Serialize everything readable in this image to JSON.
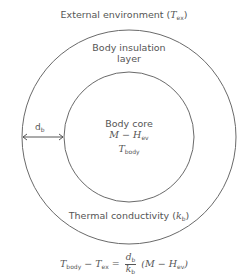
{
  "diagram": {
    "external_label": "External environment",
    "external_symbol": "T",
    "external_symbol_sub": "ex",
    "insulation_label_line1": "Body insulation",
    "insulation_label_line2": "layer",
    "core_label": "Body core",
    "core_heat_expr": "M − H",
    "core_heat_sub": "ev",
    "core_temp_symbol": "T",
    "core_temp_sub": "body",
    "thickness_label": "d",
    "thickness_sub": "b",
    "conductivity_label": "Thermal conductivity",
    "conductivity_symbol": "k",
    "conductivity_sub": "b",
    "equation": {
      "lhs_t1": "T",
      "lhs_t1_sub": "body",
      "minus": " − ",
      "lhs_t2": "T",
      "lhs_t2_sub": "ex",
      "equals": " = ",
      "frac_num": "d",
      "frac_num_sub": "b",
      "frac_den": "k",
      "frac_den_sub": "b",
      "rhs": "(M − H",
      "rhs_sub": "ev",
      "rhs_close": ")"
    },
    "colors": {
      "stroke": "#6a6a6a",
      "text": "#555555"
    }
  }
}
